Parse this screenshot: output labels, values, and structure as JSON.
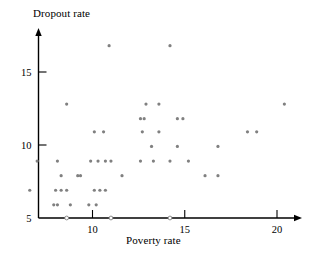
{
  "chart_data": {
    "type": "scatter",
    "title": "",
    "xlabel": "Poverty rate",
    "ylabel": "Dropout rate",
    "xlim": [
      6.2,
      21.6
    ],
    "ylim": [
      5,
      17.4
    ],
    "xticks": [
      10,
      15,
      20
    ],
    "xticklabels": [
      "10",
      "15",
      "20"
    ],
    "yticks": [
      5,
      10,
      15
    ],
    "yticklabels": [
      "5",
      "10",
      "15"
    ],
    "grid": false,
    "legend": null,
    "marker_color": "#808080",
    "axis_color": "#000000",
    "points": [
      {
        "x": 10.9,
        "y": 16.8
      },
      {
        "x": 14.2,
        "y": 16.8
      },
      {
        "x": 8.6,
        "y": 12.8
      },
      {
        "x": 12.9,
        "y": 12.8
      },
      {
        "x": 13.6,
        "y": 12.8
      },
      {
        "x": 20.4,
        "y": 12.8
      },
      {
        "x": 12.6,
        "y": 11.8
      },
      {
        "x": 12.8,
        "y": 11.8
      },
      {
        "x": 14.6,
        "y": 11.8
      },
      {
        "x": 14.9,
        "y": 11.8
      },
      {
        "x": 10.1,
        "y": 10.9
      },
      {
        "x": 10.6,
        "y": 10.9
      },
      {
        "x": 12.7,
        "y": 10.9
      },
      {
        "x": 13.6,
        "y": 10.9
      },
      {
        "x": 18.4,
        "y": 10.9
      },
      {
        "x": 18.9,
        "y": 10.9
      },
      {
        "x": 13.2,
        "y": 9.9
      },
      {
        "x": 14.6,
        "y": 9.9
      },
      {
        "x": 16.8,
        "y": 9.9
      },
      {
        "x": 7.0,
        "y": 8.9
      },
      {
        "x": 8.1,
        "y": 8.9
      },
      {
        "x": 9.9,
        "y": 8.9
      },
      {
        "x": 10.3,
        "y": 8.9
      },
      {
        "x": 10.7,
        "y": 8.9
      },
      {
        "x": 11.0,
        "y": 8.9
      },
      {
        "x": 12.6,
        "y": 8.9
      },
      {
        "x": 13.3,
        "y": 8.9
      },
      {
        "x": 14.2,
        "y": 8.9
      },
      {
        "x": 15.2,
        "y": 8.9
      },
      {
        "x": 8.3,
        "y": 7.9
      },
      {
        "x": 9.2,
        "y": 7.9
      },
      {
        "x": 9.35,
        "y": 7.9
      },
      {
        "x": 11.6,
        "y": 7.9
      },
      {
        "x": 16.1,
        "y": 7.9
      },
      {
        "x": 16.8,
        "y": 7.9
      },
      {
        "x": 6.6,
        "y": 6.9
      },
      {
        "x": 8.0,
        "y": 6.9
      },
      {
        "x": 8.3,
        "y": 6.9
      },
      {
        "x": 8.6,
        "y": 6.9
      },
      {
        "x": 10.1,
        "y": 6.9
      },
      {
        "x": 10.4,
        "y": 6.9
      },
      {
        "x": 10.7,
        "y": 6.9
      },
      {
        "x": 7.9,
        "y": 5.9
      },
      {
        "x": 8.1,
        "y": 5.9
      },
      {
        "x": 8.8,
        "y": 5.9
      },
      {
        "x": 9.8,
        "y": 5.9
      },
      {
        "x": 10.2,
        "y": 5.9
      },
      {
        "x": 8.6,
        "y": 5.0
      },
      {
        "x": 11.0,
        "y": 5.0
      },
      {
        "x": 14.2,
        "y": 5.0
      }
    ]
  }
}
